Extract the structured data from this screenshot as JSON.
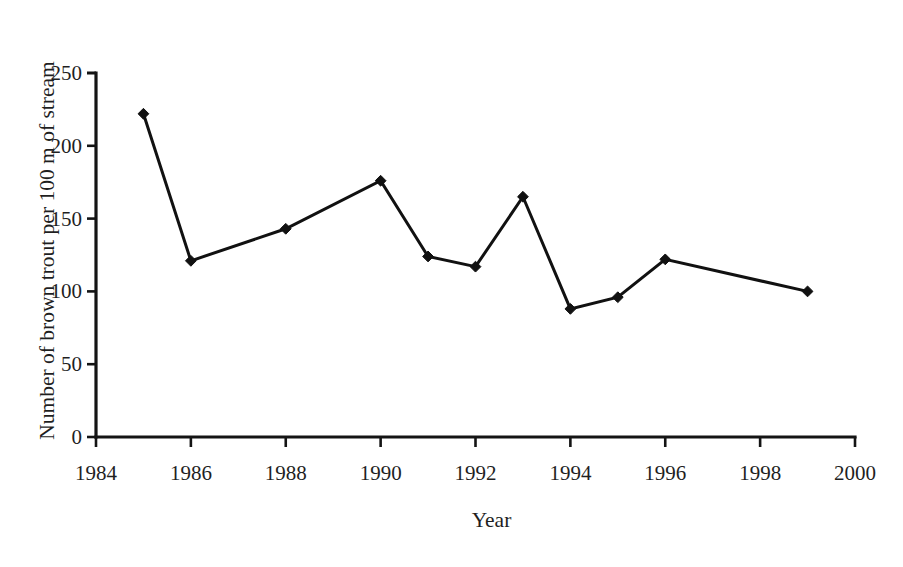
{
  "chart_data": {
    "type": "line",
    "title": "",
    "xlabel": "Year",
    "ylabel": "Number of brown trout per 100 m of stream",
    "xlim": [
      1984,
      2000
    ],
    "ylim": [
      0,
      250
    ],
    "grid": false,
    "legend": null,
    "marker": "diamond",
    "line_color": "#111111",
    "marker_color": "#111111",
    "background_color": "#ffffff",
    "x_tick_labels": [
      "1984",
      "1986",
      "1988",
      "1990",
      "1992",
      "1994",
      "1996",
      "1998",
      "2000"
    ],
    "x_ticks": [
      1984,
      1986,
      1988,
      1990,
      1992,
      1994,
      1996,
      1998,
      2000
    ],
    "y_tick_labels": [
      "0",
      "50",
      "100",
      "150",
      "200",
      "250"
    ],
    "y_ticks": [
      0,
      50,
      100,
      150,
      200,
      250
    ],
    "x": [
      1985,
      1986,
      1988,
      1990,
      1991,
      1992,
      1993,
      1994,
      1995,
      1996,
      1999
    ],
    "values": [
      222,
      121,
      143,
      176,
      124,
      117,
      165,
      88,
      96,
      122,
      100
    ],
    "points": [
      {
        "x": 1985,
        "y": 222
      },
      {
        "x": 1986,
        "y": 121
      },
      {
        "x": 1988,
        "y": 143
      },
      {
        "x": 1990,
        "y": 176
      },
      {
        "x": 1991,
        "y": 124
      },
      {
        "x": 1992,
        "y": 117
      },
      {
        "x": 1993,
        "y": 165
      },
      {
        "x": 1994,
        "y": 88
      },
      {
        "x": 1995,
        "y": 96
      },
      {
        "x": 1996,
        "y": 122
      },
      {
        "x": 1999,
        "y": 100
      }
    ]
  }
}
